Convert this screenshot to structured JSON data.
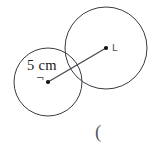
{
  "figure": {
    "background_color": "#ffffff",
    "stroke_color": "#3a3a42",
    "width": 163,
    "height": 150
  },
  "labels": {
    "length": "5 cm",
    "small_circle_center": "¬",
    "large_circle_center": "L",
    "bottom_mark": "("
  },
  "chart_data": {
    "type": "scatter",
    "title": "",
    "xlabel": "",
    "ylabel": "",
    "grid": false,
    "legend": "none",
    "shapes": [
      {
        "name": "small-circle",
        "kind": "circle",
        "cx": 48,
        "cy": 82,
        "r": 34,
        "stroke": "#3a3a42",
        "fill": "none"
      },
      {
        "name": "large-circle",
        "kind": "circle",
        "cx": 106,
        "cy": 48,
        "r": 41,
        "stroke": "#3a3a42",
        "fill": "none"
      },
      {
        "name": "center-to-center-segment",
        "kind": "line",
        "x1": 48,
        "y1": 82,
        "x2": 106,
        "y2": 48,
        "stroke": "#43434b"
      },
      {
        "name": "small-circle-center-point",
        "kind": "point",
        "cx": 48,
        "cy": 82,
        "r": 2.1,
        "fill": "#111114"
      },
      {
        "name": "large-circle-center-point",
        "kind": "point",
        "cx": 106,
        "cy": 48,
        "r": 2.1,
        "fill": "#111114"
      }
    ],
    "annotations": [
      {
        "text": "5 cm",
        "x": 27,
        "y": 58
      },
      {
        "text": "¬",
        "x": 36,
        "y": 74
      },
      {
        "text": "L",
        "x": 112,
        "y": 43
      },
      {
        "text": "(",
        "x": 95,
        "y": 122
      }
    ]
  }
}
